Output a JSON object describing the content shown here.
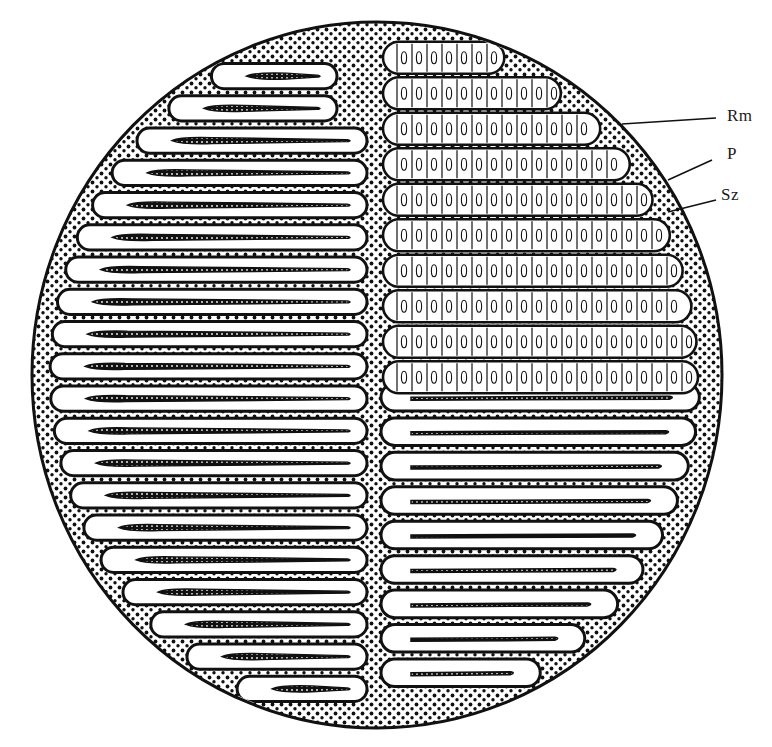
{
  "figure": {
    "type": "biological cross-section illustration",
    "colors": {
      "ink": "#111111",
      "paper": "#ffffff"
    },
    "ellipse": {
      "cx": 377,
      "cy": 375,
      "rx": 345,
      "ry": 353
    },
    "divider_x": 375,
    "left_lamellae_count": 20,
    "right_lower_lamellae_count": 9,
    "right_upper_cell_rows": 10
  },
  "labels": [
    {
      "id": "rm",
      "text": "Rm",
      "x": 727,
      "y": 107,
      "line": [
        622,
        124,
        716,
        118
      ]
    },
    {
      "id": "p",
      "text": "P",
      "x": 727,
      "y": 145,
      "line": [
        668,
        180,
        712,
        160
      ]
    },
    {
      "id": "sz",
      "text": "Sz",
      "x": 721,
      "y": 186,
      "line": [
        668,
        212,
        716,
        200
      ]
    }
  ]
}
